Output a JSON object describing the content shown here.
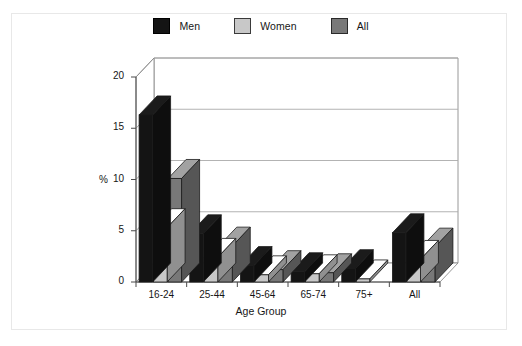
{
  "figure": {
    "background": "#ffffff",
    "frame_color": "#e8e8e8"
  },
  "legend": {
    "position": "top-center",
    "entries": [
      {
        "label": "Men",
        "color": "#141414",
        "edge": "#000000"
      },
      {
        "label": "Women",
        "color": "#c8c8c8",
        "edge": "#3a3a3a"
      },
      {
        "label": "All",
        "color": "#787878",
        "edge": "#2a2a2a"
      }
    ]
  },
  "chart_data": {
    "type": "bar",
    "title": "",
    "subtitle": "",
    "xlabel": "Age Group",
    "ylabel": "%",
    "categories": [
      "16-24",
      "25-44",
      "45-64",
      "65-74",
      "75+",
      "All"
    ],
    "series": [
      {
        "name": "Men",
        "color": "#141414",
        "values": [
          16.3,
          4.7,
          1.6,
          1.0,
          1.3,
          4.8
        ]
      },
      {
        "name": "Women",
        "color": "#c8c8c8",
        "values": [
          5.3,
          2.4,
          0.7,
          0.8,
          0.3,
          2.2
        ]
      },
      {
        "name": "All",
        "color": "#787878",
        "values": [
          10.1,
          3.5,
          1.2,
          0.9,
          0.0,
          3.4
        ]
      }
    ],
    "ylim": [
      0,
      20
    ],
    "yticks": [
      0,
      5,
      10,
      15,
      20
    ],
    "ytick_labels": [
      "0",
      "5",
      "10",
      "15",
      "20"
    ],
    "grid": "horizontal",
    "grid_color": "#aaaaaa",
    "three_d": true,
    "legend_position": "top-center"
  }
}
